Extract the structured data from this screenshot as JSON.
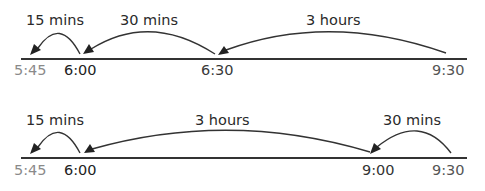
{
  "diagram": {
    "type": "timeline-backward-counting",
    "rows": [
      {
        "intervals": [
          {
            "label": "15 mins",
            "from": "6:00",
            "to": "5:45"
          },
          {
            "label": "30 mins",
            "from": "6:30",
            "to": "6:00"
          },
          {
            "label": "3 hours",
            "from": "9:30",
            "to": "6:30"
          }
        ],
        "ticks": [
          {
            "label": "5:45",
            "color": "#8a8a8a"
          },
          {
            "label": "6:00",
            "color": "#222222"
          },
          {
            "label": "6:30",
            "color": "#3a3a3a"
          },
          {
            "label": "9:30",
            "color": "#555555"
          }
        ]
      },
      {
        "intervals": [
          {
            "label": "15 mins",
            "from": "6:00",
            "to": "5:45"
          },
          {
            "label": "3 hours",
            "from": "9:00",
            "to": "6:00"
          },
          {
            "label": "30 mins",
            "from": "9:30",
            "to": "9:00"
          }
        ],
        "ticks": [
          {
            "label": "5:45",
            "color": "#8a8a8a"
          },
          {
            "label": "6:00",
            "color": "#222222"
          },
          {
            "label": "9:00",
            "color": "#333333"
          },
          {
            "label": "9:30",
            "color": "#555555"
          }
        ]
      }
    ],
    "colors": {
      "line": "#333333",
      "arrow": "#222222",
      "text": "#2a2a2a"
    }
  }
}
